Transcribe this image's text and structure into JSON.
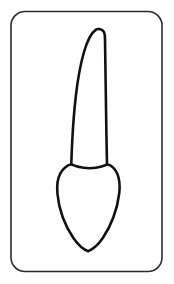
{
  "figure": {
    "background_color": "#ffffff",
    "ink_color": "#111111",
    "frame_color": "#2b2b2b",
    "canvas": {
      "width": 174,
      "height": 284
    }
  },
  "frame": {
    "name": "rounded-rectangle-border",
    "x": 11,
    "y": 11.5,
    "width": 151,
    "height": 260,
    "corner_radius": 14,
    "stroke_width": 1.6,
    "stroke_color": "#2b2b2b"
  },
  "tooth": {
    "name": "tooth-outline",
    "view": "proximal",
    "stroke_width": 2.6,
    "stroke_color": "#111111",
    "fill_color": "#ffffff",
    "parts": [
      {
        "name": "root",
        "label": "Root",
        "apex_point": [
          99,
          29
        ],
        "apex_shape": "narrow rounded",
        "curvature": "curves toward the left going apically",
        "cervical_width": 37
      },
      {
        "name": "crown",
        "label": "Crown",
        "shape": "pentagonal with pointed incisal edge",
        "widest_width": 62,
        "incisal_tip": [
          87,
          251
        ]
      },
      {
        "name": "cervical-line",
        "label": "Cementoenamel junction",
        "shape": "arc curving apically",
        "y": 167
      }
    ],
    "paths": {
      "root_and_crown": "M 99 29 C 104.5 29.8 105.0 33.5 105.0 39.0 C 105.4 62 105.9 100 106.4 134 C 106.7 148 106.9 157 107.0 164.2 C 111.5 165.2 115.0 168.6 117.2 173.5 C 119.6 179.0 120.1 186.0 119.2 193.5 C 118.3 201.5 116.2 209.8 113.4 217.3 C 110.6 224.9 107.0 231.9 102.8 238.0 C 98.6 244.1 93.8 249.0 88.2 251.2 C 83.0 249.4 78.0 244.6 73.7 238.5 C 69.3 232.3 65.6 225.1 62.8 217.5 C 60.0 209.8 58.1 201.5 57.4 193.5 C 56.7 185.8 57.5 178.6 60.5 173.2 C 63.2 168.3 67.0 165.3 71.3 164.2 C 71.5 157.5 71.8 150 72.2 142 C 72.9 128 74.0 112 75.8 96.5 C 77.6 80.5 80.2 65.0 84.0 52.0 C 87.1 41.3 91.3 32.8 96.0 29.6 C 97.0 29.0 98.0 28.9 99 29 Z",
      "cervical_line": "M 71.3 164.4 C 74.5 165.9 78.5 167.2 83.5 167.8 C 89.5 168.5 96.5 168.1 101.5 166.6 C 103.8 165.9 105.6 165.2 107.0 164.4"
    }
  }
}
